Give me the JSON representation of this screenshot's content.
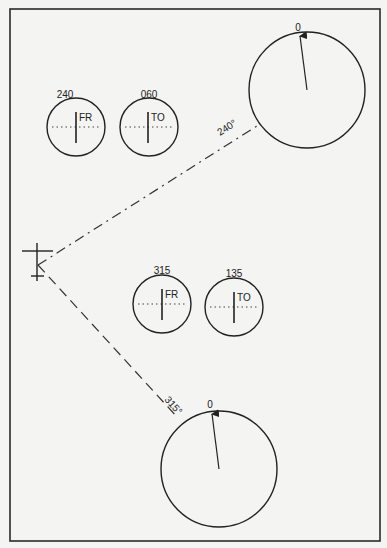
{
  "diagram": {
    "frame": {
      "stroke": "#2a2a2a",
      "background": "#f4f4f2"
    },
    "aircraft_symbol": {
      "label": "aircraft-position"
    },
    "radials": [
      {
        "label": "240°",
        "style": "dash-dot"
      },
      {
        "label": "315°",
        "style": "dashed"
      }
    ],
    "upper_group": {
      "indicators": [
        {
          "course": "240",
          "flag": "FR"
        },
        {
          "course": "060",
          "flag": "TO"
        }
      ],
      "bearing_dial": {
        "top_label": "0"
      }
    },
    "lower_group": {
      "indicators": [
        {
          "course": "315",
          "flag": "FR"
        },
        {
          "course": "135",
          "flag": "TO"
        }
      ],
      "bearing_dial": {
        "top_label": "0"
      }
    }
  }
}
